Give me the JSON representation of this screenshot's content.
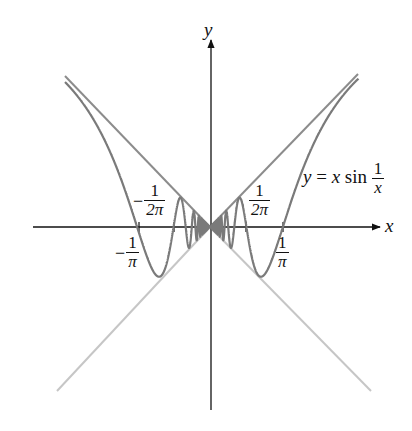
{
  "chart_data": {
    "type": "line",
    "title": "",
    "xlabel": "x",
    "ylabel": "y",
    "grid": false,
    "legend": "none",
    "function": "y = x sin(1/x)",
    "xlim": [
      -0.633,
      0.72
    ],
    "ylim": [
      -0.8,
      0.8
    ],
    "series": [
      {
        "name": "y = x sin(1/x)",
        "color": "#7a7a7a",
        "x_range": [
          -0.633,
          0.648
        ]
      },
      {
        "name": "y = |x| (upper bound)",
        "color": "#8a8a8a",
        "x_range": [
          -0.633,
          0.648
        ]
      },
      {
        "name": "y = -|x| (lower bound)",
        "color": "#c4c4c4",
        "x_range": [
          -0.67,
          0.69
        ]
      }
    ],
    "tick_marks": [
      {
        "value": "-1/π",
        "x": -0.3183
      },
      {
        "value": "-1/(2π)",
        "x": -0.1592
      },
      {
        "value": "1/(2π)",
        "x": 0.1592
      },
      {
        "value": "1/π",
        "x": 0.3183
      }
    ],
    "pixel_mapping": {
      "origin_x": 210,
      "origin_y": 227,
      "px_per_unit": 229
    }
  },
  "labels": {
    "y_axis": "y",
    "x_axis": "x",
    "function_label": {
      "lhs": "y",
      "eq": "=",
      "x": "x",
      "sin": "sin",
      "num": "1",
      "den": "x"
    },
    "tick_neg_pi": {
      "sign": "−",
      "num": "1",
      "den": "π"
    },
    "tick_neg_2pi": {
      "sign": "−",
      "num": "1",
      "den": "2π"
    },
    "tick_pos_2pi": {
      "num": "1",
      "den": "2π"
    },
    "tick_pos_pi": {
      "num": "1",
      "den": "π"
    }
  }
}
